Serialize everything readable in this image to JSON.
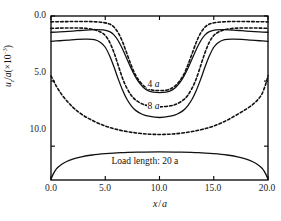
{
  "chart_data": {
    "type": "line",
    "title": "",
    "xlabel": "x/a",
    "ylabel": "u_z/a(×10⁻³)",
    "ylabel_parts": {
      "var": "u",
      "sub": "z",
      "mid": "/a(×10",
      "exp": "−3",
      "close": ")"
    },
    "xlabel_parts": {
      "x": "x",
      "slash": "/",
      "a": "a"
    },
    "xlim": [
      0.0,
      20.0
    ],
    "ylim": [
      0.0,
      12.6
    ],
    "y_inverted": true,
    "grid": false,
    "legend": "inline-annotations",
    "xticks": [
      "0.0",
      "5.0",
      "10.0",
      "15.0",
      "20.0"
    ],
    "xtick_values": [
      0.0,
      5.0,
      10.0,
      15.0,
      20.0
    ],
    "yticks": [
      "0.0",
      "5.0",
      "10.0"
    ],
    "ytick_values": [
      0.0,
      5.0,
      10.0
    ],
    "annotations": [
      {
        "text": "4 a",
        "x": 10.0,
        "y": 5.35,
        "name": "curve-label-4a"
      },
      {
        "text": "8 a",
        "x": 10.0,
        "y": 7.05,
        "name": "curve-label-8a"
      },
      {
        "text": "Load length: 20 a",
        "x": 10.0,
        "y": 11.2,
        "name": "load-length-note"
      }
    ],
    "series": [
      {
        "name": "4a solid",
        "load_length": "4 a",
        "style": "solid",
        "x": [
          0.0,
          0.8,
          1.6,
          2.4,
          3.2,
          4.0,
          4.8,
          5.4,
          5.8,
          6.2,
          6.6,
          7.0,
          7.4,
          7.8,
          8.2,
          8.6,
          9.0,
          9.4,
          10.0,
          10.6,
          11.0,
          11.4,
          11.8,
          12.2,
          12.6,
          13.0,
          13.4,
          13.8,
          14.2,
          14.6,
          15.2,
          16.0,
          16.8,
          17.6,
          18.4,
          19.2,
          20.0
        ],
        "y": [
          1.25,
          1.22,
          1.18,
          1.13,
          1.08,
          1.05,
          1.07,
          1.2,
          1.45,
          1.9,
          2.55,
          3.3,
          4.05,
          4.7,
          5.2,
          5.55,
          5.75,
          5.85,
          5.88,
          5.85,
          5.75,
          5.55,
          5.2,
          4.7,
          4.05,
          3.3,
          2.55,
          1.9,
          1.45,
          1.2,
          1.07,
          1.05,
          1.08,
          1.13,
          1.18,
          1.22,
          1.25
        ]
      },
      {
        "name": "4a dashed",
        "load_length": "4 a",
        "style": "dashed",
        "x": [
          0.0,
          0.8,
          1.6,
          2.4,
          3.2,
          4.0,
          4.8,
          5.4,
          5.8,
          6.2,
          6.6,
          7.0,
          7.4,
          7.8,
          8.2,
          8.6,
          9.0,
          9.4,
          10.0,
          10.6,
          11.0,
          11.4,
          11.8,
          12.2,
          12.6,
          13.0,
          13.4,
          13.8,
          14.2,
          14.6,
          15.2,
          16.0,
          16.8,
          17.6,
          18.4,
          19.2,
          20.0
        ],
        "y": [
          0.45,
          0.44,
          0.43,
          0.42,
          0.42,
          0.44,
          0.5,
          0.62,
          0.85,
          1.3,
          2.0,
          2.9,
          3.8,
          4.55,
          5.05,
          5.4,
          5.6,
          5.7,
          5.73,
          5.7,
          5.6,
          5.4,
          5.05,
          4.55,
          3.8,
          2.9,
          2.0,
          1.3,
          0.85,
          0.62,
          0.5,
          0.44,
          0.42,
          0.42,
          0.43,
          0.44,
          0.45
        ]
      },
      {
        "name": "8a solid",
        "load_length": "8 a",
        "style": "solid",
        "x": [
          0.0,
          0.8,
          1.6,
          2.4,
          3.2,
          4.0,
          4.6,
          5.0,
          5.4,
          5.8,
          6.2,
          6.6,
          7.0,
          7.4,
          7.8,
          8.4,
          9.0,
          10.0,
          11.0,
          11.6,
          12.2,
          12.6,
          13.0,
          13.4,
          13.8,
          14.2,
          14.6,
          15.0,
          15.4,
          16.0,
          16.8,
          17.6,
          18.4,
          19.2,
          20.0
        ],
        "y": [
          1.95,
          1.9,
          1.85,
          1.8,
          1.78,
          1.82,
          2.05,
          2.4,
          3.05,
          3.9,
          4.85,
          5.7,
          6.4,
          6.9,
          7.25,
          7.55,
          7.7,
          7.8,
          7.7,
          7.55,
          7.25,
          6.9,
          6.4,
          5.7,
          4.85,
          3.9,
          3.05,
          2.4,
          2.05,
          1.82,
          1.78,
          1.8,
          1.85,
          1.9,
          1.95
        ]
      },
      {
        "name": "8a dashed",
        "load_length": "8 a",
        "style": "dashed",
        "x": [
          0.0,
          0.8,
          1.6,
          2.4,
          3.2,
          4.0,
          4.6,
          5.0,
          5.4,
          5.8,
          6.2,
          6.6,
          7.0,
          7.4,
          7.8,
          8.4,
          9.0,
          10.0,
          11.0,
          11.6,
          12.2,
          12.6,
          13.0,
          13.4,
          13.8,
          14.2,
          14.6,
          15.0,
          15.4,
          16.0,
          16.8,
          17.6,
          18.4,
          19.2,
          20.0
        ],
        "y": [
          0.95,
          0.93,
          0.92,
          0.92,
          0.95,
          1.05,
          1.25,
          1.5,
          2.0,
          2.8,
          3.8,
          4.8,
          5.55,
          6.1,
          6.45,
          6.75,
          6.9,
          6.98,
          6.9,
          6.75,
          6.45,
          6.1,
          5.55,
          4.8,
          3.8,
          2.8,
          2.0,
          1.5,
          1.25,
          1.05,
          0.95,
          0.92,
          0.92,
          0.93,
          0.95
        ]
      },
      {
        "name": "20a solid",
        "load_length": "20 a",
        "style": "solid",
        "x": [
          0.0,
          0.2,
          0.5,
          0.9,
          1.4,
          2.0,
          2.8,
          3.8,
          5.0,
          6.4,
          8.0,
          10.0,
          12.0,
          13.6,
          15.0,
          16.2,
          17.2,
          18.0,
          18.6,
          19.1,
          19.5,
          19.8,
          20.0
        ],
        "y": [
          12.55,
          12.15,
          11.75,
          11.45,
          11.2,
          11.0,
          10.82,
          10.68,
          10.58,
          10.5,
          10.46,
          10.44,
          10.46,
          10.5,
          10.58,
          10.68,
          10.82,
          11.0,
          11.2,
          11.45,
          11.75,
          12.15,
          12.55
        ]
      },
      {
        "name": "20a dashed",
        "load_length": "20 a",
        "style": "dashed",
        "x": [
          0.0,
          0.5,
          1.0,
          1.6,
          2.2,
          3.0,
          4.0,
          5.0,
          6.0,
          7.0,
          8.0,
          9.0,
          10.0,
          11.0,
          12.0,
          13.0,
          14.0,
          15.0,
          16.0,
          17.0,
          18.0,
          18.8,
          19.4,
          19.8,
          20.0
        ],
        "y": [
          4.6,
          5.4,
          6.05,
          6.65,
          7.15,
          7.65,
          8.1,
          8.45,
          8.7,
          8.88,
          9.0,
          9.08,
          9.1,
          9.08,
          9.0,
          8.88,
          8.7,
          8.45,
          8.1,
          7.65,
          7.15,
          6.65,
          6.05,
          5.2,
          4.6
        ]
      }
    ],
    "colors": {
      "line": "#111111",
      "frame": "#000000",
      "background": "#ffffff"
    }
  }
}
